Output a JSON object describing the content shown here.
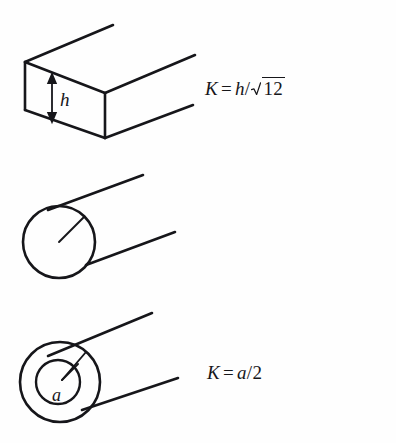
{
  "figure": {
    "background_color": "#fefefe",
    "ink_color": "#16161a",
    "width": 396,
    "height": 443
  },
  "rows": [
    {
      "name": "rectangular-bar",
      "shape": "rectangular bar in oblique 3D projection",
      "formula": {
        "lhs": "K",
        "equals": "=",
        "numerator": "h",
        "slash": "/",
        "radical": "12",
        "plain": "K = h/√12"
      },
      "labels": [
        {
          "name": "height-label",
          "text": "h"
        }
      ]
    },
    {
      "name": "solid-cylinder",
      "shape": "solid circular cylinder with radius line",
      "formula": {
        "lhs": "K",
        "equals": "=",
        "numerator": "a",
        "slash": "/",
        "denominator": "2",
        "plain": "K = a/2"
      },
      "labels": [
        {
          "name": "radius-label",
          "text": "a"
        }
      ]
    },
    {
      "name": "hollow-tube",
      "shape": "hollow circular tube (annulus) with outer and inner radius lines",
      "formula": {
        "lhs": "K",
        "equals": "=",
        "open_paren": "(",
        "radicand_first": "a",
        "exp_first": "2",
        "plus": "+",
        "radicand_second": "b",
        "exp_second": "2",
        "close_paren": ")",
        "slash": "/",
        "denominator": "2",
        "plain": "K = (√(a² + b²))/2"
      },
      "labels": [
        {
          "name": "outer-radius-label",
          "text": "a"
        },
        {
          "name": "inner-radius-label",
          "text": "b"
        }
      ]
    }
  ]
}
